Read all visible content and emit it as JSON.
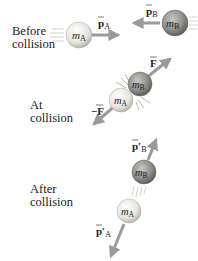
{
  "stages": [
    {
      "id": "before",
      "label_line1": "Before",
      "label_line2": "collision"
    },
    {
      "id": "at",
      "label_line1": "At",
      "label_line2": "collision"
    },
    {
      "id": "after",
      "label_line1": "After",
      "label_line2": "collision"
    }
  ],
  "masses": {
    "a": "m",
    "a_sub": "A",
    "b": "m",
    "b_sub": "B"
  },
  "vectors": {
    "pA": {
      "sym": "p",
      "sub": "A"
    },
    "pB": {
      "sym": "p",
      "sub": "B"
    },
    "F": {
      "sym": "F"
    },
    "negF": {
      "sym": "−F"
    },
    "pA_prime": {
      "sym": "p′",
      "sub": "A"
    },
    "pB_prime": {
      "sym": "p′",
      "sub": "B"
    }
  },
  "colors": {
    "ball_a": "#e8e6e0",
    "ball_b": "#8a8a86",
    "arrow": "#9a9a98",
    "text": "#222222"
  }
}
